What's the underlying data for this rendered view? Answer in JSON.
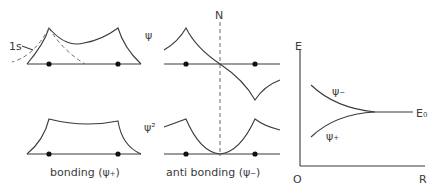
{
  "diagram": {
    "panels": {
      "bonding_psi": {
        "y_label": "ψ",
        "orbital_label": "1s"
      },
      "bonding_psi2": {
        "caption": "bonding (ψ₊)"
      },
      "antibonding_psi": {
        "node_label": "N"
      },
      "antibonding_psi2": {
        "y_label": "ψ²",
        "caption": "anti bonding (ψ₋)"
      },
      "energy_plot": {
        "y_axis_label": "E",
        "x_axis_label": "R",
        "origin_label": "O",
        "asymptote_label": "E₀",
        "upper_curve_label": "ψ₋",
        "lower_curve_label": "ψ₊"
      }
    },
    "colors": {
      "line": "#3a3a3a",
      "dashed": "#6a6a6a",
      "background": "#ffffff"
    }
  }
}
